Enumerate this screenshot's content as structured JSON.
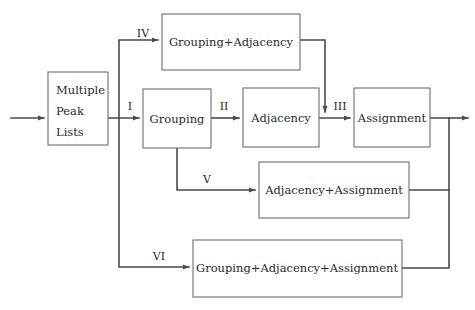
{
  "diagram": {
    "background_color": "#ffffff",
    "line_color": "#4a4a4a",
    "box_stroke_color": "#6e6e6e",
    "text_color": "#2a2a2a",
    "nodes": [
      {
        "id": "multiple-peak-lists",
        "lines": [
          "Multiple",
          "Peak",
          "Lists"
        ],
        "label": "Multiple Peak Lists"
      },
      {
        "id": "grouping",
        "label": "Grouping"
      },
      {
        "id": "adjacency",
        "label": "Adjacency"
      },
      {
        "id": "assignment",
        "label": "Assignment"
      },
      {
        "id": "grouping-adjacency",
        "label": "Grouping+Adjacency"
      },
      {
        "id": "adjacency-assignment",
        "label": "Adjacency+Assignment"
      },
      {
        "id": "grouping-adjacency-assignment",
        "label": "Grouping+Adjacency+Assignment"
      }
    ],
    "edge_labels": [
      {
        "id": "edge-i",
        "label": "I"
      },
      {
        "id": "edge-ii",
        "label": "II"
      },
      {
        "id": "edge-iii",
        "label": "III"
      },
      {
        "id": "edge-iv",
        "label": "IV"
      },
      {
        "id": "edge-v",
        "label": "V"
      },
      {
        "id": "edge-vi",
        "label": "VI"
      }
    ]
  }
}
